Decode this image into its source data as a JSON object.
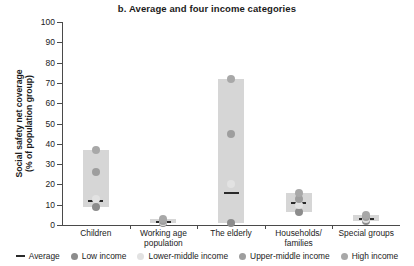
{
  "chart_data": {
    "type": "bar",
    "title": "b. Average and four income categories",
    "xlabel": "",
    "ylabel": "Social safety net coverage\n(% of population group)",
    "ylabel_line1": "Social safety net coverage",
    "ylabel_line2": "(% of population group)",
    "ylim": [
      0,
      100
    ],
    "yticks": [
      0,
      10,
      20,
      30,
      40,
      50,
      60,
      70,
      80,
      90,
      100
    ],
    "grid": false,
    "legend_position": "bottom",
    "categories": [
      "Children",
      "Working age population",
      "The elderly",
      "Households/ families",
      "Special groups"
    ],
    "category_labels": [
      "Children",
      "Working age\npopulation",
      "The elderly",
      "Households/\nfamilies",
      "Special groups"
    ],
    "series": [
      {
        "name": "Average",
        "marker": "dash",
        "color": "#2a2a2a",
        "values": [
          12,
          1.5,
          16,
          11,
          3
        ]
      },
      {
        "name": "Low income",
        "marker": "dot",
        "color": "#8c8c8c",
        "values": [
          9,
          1,
          1,
          6.5,
          2
        ]
      },
      {
        "name": "Lower-middle income",
        "marker": "dot",
        "color": "#e2e2e2",
        "values": [
          13,
          1.5,
          20,
          10,
          3
        ]
      },
      {
        "name": "Upper-middle income",
        "marker": "dot",
        "color": "#9e9e9e",
        "values": [
          26,
          2,
          45,
          13,
          4
        ]
      },
      {
        "name": "High income",
        "marker": "dot",
        "color": "#a8a8a8",
        "values": [
          37,
          3,
          72,
          16,
          5
        ]
      }
    ],
    "range_bars": [
      {
        "category": "Children",
        "low": 9,
        "high": 37
      },
      {
        "category": "Working age population",
        "low": 1,
        "high": 3
      },
      {
        "category": "The elderly",
        "low": 1,
        "high": 72
      },
      {
        "category": "Households/ families",
        "low": 6.5,
        "high": 16
      },
      {
        "category": "Special groups",
        "low": 2,
        "high": 5
      }
    ],
    "bar_color": "#d6d6d6"
  },
  "legend": {
    "items": [
      {
        "label": "Average",
        "marker": "dash",
        "color": "#2a2a2a"
      },
      {
        "label": "Low income",
        "marker": "dot",
        "color": "#8c8c8c"
      },
      {
        "label": "Lower-middle income",
        "marker": "dot",
        "color": "#e2e2e2"
      },
      {
        "label": "Upper-middle income",
        "marker": "dot",
        "color": "#9e9e9e"
      },
      {
        "label": "High income",
        "marker": "dot",
        "color": "#a8a8a8"
      }
    ]
  }
}
